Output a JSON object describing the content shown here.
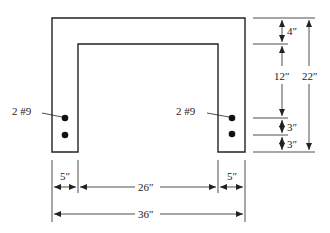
{
  "diagram": {
    "type": "channel-section-dimensions",
    "labels": {
      "left_bars": "2 #9",
      "right_bars": "2 #9",
      "top_flange": "4″",
      "web_depth": "12″",
      "overall_height": "22″",
      "bar_spacing_1": "3″",
      "bar_spacing_2": "3″",
      "left_leg_width": "5″",
      "inner_width": "26″",
      "right_leg_width": "5″",
      "overall_width": "36″"
    },
    "dimensions_in": {
      "overall_width": 36,
      "leg_width": 5,
      "inner_width": 26,
      "overall_height": 22,
      "top_thickness": 4,
      "depth_to_first_bar_zone": 12,
      "bar_spacing": 3,
      "bottom_cover": 3
    },
    "colors": {
      "line": "#222222",
      "background": "#ffffff"
    }
  }
}
